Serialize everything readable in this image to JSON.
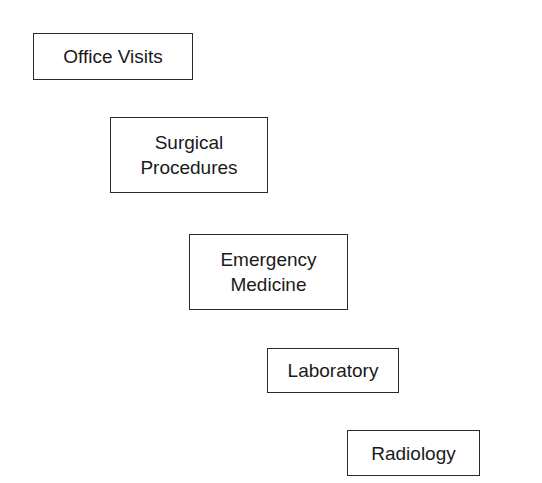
{
  "diagram": {
    "type": "staircase",
    "boxes": [
      {
        "id": "office-visits",
        "label": "Office Visits",
        "x": 33,
        "y": 33,
        "w": 160,
        "h": 47
      },
      {
        "id": "surgical-procedures",
        "label": "Surgical\nProcedures",
        "x": 110,
        "y": 117,
        "w": 158,
        "h": 76
      },
      {
        "id": "emergency-medicine",
        "label": "Emergency\nMedicine",
        "x": 189,
        "y": 234,
        "w": 159,
        "h": 76
      },
      {
        "id": "laboratory",
        "label": "Laboratory",
        "x": 267,
        "y": 348,
        "w": 132,
        "h": 45
      },
      {
        "id": "radiology",
        "label": "Radiology",
        "x": 347,
        "y": 430,
        "w": 133,
        "h": 46
      }
    ]
  }
}
